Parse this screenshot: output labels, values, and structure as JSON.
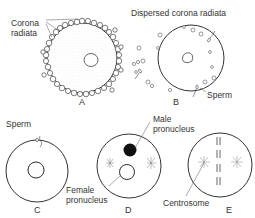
{
  "figure": {
    "panels": [
      {
        "id": "A",
        "letter": "A",
        "label": "Corona radiata",
        "label_line1": "Corona",
        "label_line2": "radiata"
      },
      {
        "id": "B",
        "letter": "B",
        "title": "Dispersed corona radiata",
        "label": "Sperm"
      },
      {
        "id": "C",
        "letter": "C",
        "label": "Sperm"
      },
      {
        "id": "D",
        "letter": "D",
        "label_male_line1": "Male",
        "label_male_line2": "pronucleus",
        "label_female_line1": "Female",
        "label_female_line2": "pronucleus"
      },
      {
        "id": "E",
        "letter": "E",
        "label": "Centrosome"
      }
    ]
  }
}
